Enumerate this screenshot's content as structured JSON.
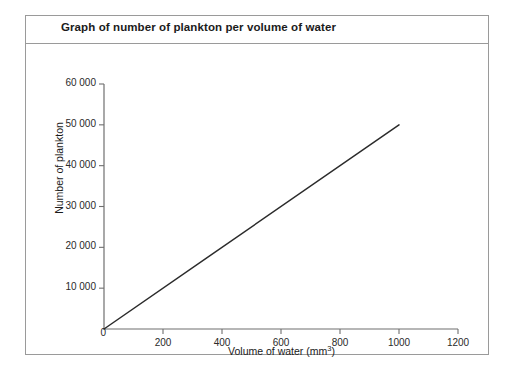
{
  "card": {
    "title": "Graph of number of plankton per volume of water"
  },
  "chart_data": {
    "type": "line",
    "title": "Graph of number of plankton per volume of water",
    "xlabel": "Volume of water (mm3)",
    "xlabel_base": "Volume of water (mm",
    "xlabel_sup": "3",
    "xlabel_tail": ")",
    "ylabel": "Number of plankton",
    "xlim": [
      0,
      1200
    ],
    "ylim": [
      0,
      60000
    ],
    "grid": false,
    "legend": null,
    "x_ticks": [
      0,
      200,
      400,
      600,
      800,
      1000,
      1200
    ],
    "x_tick_labels": [
      "0",
      "200",
      "400",
      "600",
      "800",
      "1000",
      "1200"
    ],
    "y_ticks": [
      0,
      10000,
      20000,
      30000,
      40000,
      50000,
      60000
    ],
    "y_tick_labels": [
      "0",
      "10 000",
      "20 000",
      "30 000",
      "40 000",
      "50 000",
      "60 000"
    ],
    "series": [
      {
        "name": "plankton count",
        "color": "#2b2b2b",
        "x": [
          0,
          1000
        ],
        "values": [
          0,
          50000
        ],
        "slope_per_mm3": 50,
        "points": [
          {
            "x": 0,
            "y": 0
          },
          {
            "x": 200,
            "y": 10000
          },
          {
            "x": 400,
            "y": 20000
          },
          {
            "x": 600,
            "y": 30000
          },
          {
            "x": 800,
            "y": 40000
          },
          {
            "x": 1000,
            "y": 50000
          }
        ]
      }
    ]
  },
  "colors": {
    "frame": "#9a9a9a",
    "axis": "#6f6f6f",
    "line": "#2b2b2b",
    "text": "#1b1b1b",
    "background": "#ffffff"
  }
}
